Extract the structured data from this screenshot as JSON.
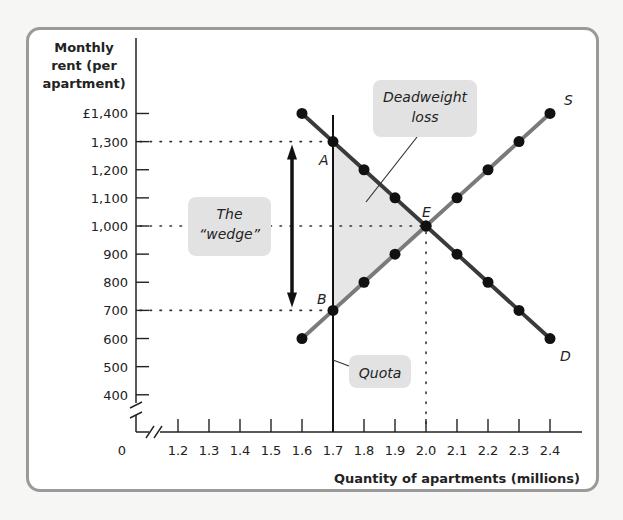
{
  "chart_data": {
    "type": "line",
    "title": "",
    "ylabel": "Monthly rent (per apartment)",
    "ylabel_lines": [
      "Monthly",
      "rent (per",
      "apartment)"
    ],
    "xlabel": "Quantity of apartments (millions)",
    "origin_label": "0",
    "y_ticks": [
      "£1,400",
      "1,300",
      "1,200",
      "1,100",
      "1,000",
      "900",
      "800",
      "700",
      "600",
      "500",
      "400"
    ],
    "y_tick_values": [
      1400,
      1300,
      1200,
      1100,
      1000,
      900,
      800,
      700,
      600,
      500,
      400
    ],
    "x_ticks": [
      "1.2",
      "1.3",
      "1.4",
      "1.5",
      "1.6",
      "1.7",
      "1.8",
      "1.9",
      "2.0",
      "2.1",
      "2.2",
      "2.3",
      "2.4"
    ],
    "x_tick_values": [
      1.2,
      1.3,
      1.4,
      1.5,
      1.6,
      1.7,
      1.8,
      1.9,
      2.0,
      2.1,
      2.2,
      2.3,
      2.4
    ],
    "ylim": [
      400,
      1400
    ],
    "xlim": [
      1.2,
      2.4
    ],
    "axis_breaks": true,
    "grid": false,
    "series": [
      {
        "name": "D",
        "label": "D",
        "color": "#3a3a3a",
        "x": [
          1.6,
          1.7,
          1.8,
          1.9,
          2.0,
          2.1,
          2.2,
          2.3,
          2.4
        ],
        "y": [
          1400,
          1300,
          1200,
          1100,
          1000,
          900,
          800,
          700,
          600
        ]
      },
      {
        "name": "S",
        "label": "S",
        "color": "#7a7a7a",
        "x": [
          1.6,
          1.7,
          1.8,
          1.9,
          2.0,
          2.1,
          2.2,
          2.3,
          2.4
        ],
        "y": [
          600,
          700,
          800,
          900,
          1000,
          1100,
          1200,
          1300,
          1400
        ]
      }
    ],
    "quota": {
      "x": 1.7,
      "label": "Quota"
    },
    "points": [
      {
        "label": "A",
        "x": 1.7,
        "y": 1300
      },
      {
        "label": "B",
        "x": 1.7,
        "y": 700
      },
      {
        "label": "E",
        "x": 2.0,
        "y": 1000
      }
    ],
    "reference_lines": [
      {
        "axis": "y",
        "value": 1300,
        "to_x": 1.7
      },
      {
        "axis": "y",
        "value": 1000,
        "to_x": 2.0
      },
      {
        "axis": "y",
        "value": 700,
        "to_x": 1.7
      },
      {
        "axis": "x",
        "value": 2.0,
        "to_y": 1000
      }
    ],
    "shaded_region": {
      "name": "Deadweight loss",
      "vertices": [
        [
          1.7,
          1300
        ],
        [
          2.0,
          1000
        ],
        [
          1.7,
          700
        ]
      ],
      "color": "#e6e6e6"
    },
    "annotations": [
      {
        "text": "Deadweight loss",
        "lines": [
          "Deadweight",
          "loss"
        ]
      },
      {
        "text": "The “wedge”",
        "lines": [
          "The",
          "“wedge”"
        ]
      },
      {
        "text": "Quota"
      }
    ],
    "wedge_arrow": {
      "x_px": 292,
      "from": 700,
      "to": 1300
    }
  }
}
